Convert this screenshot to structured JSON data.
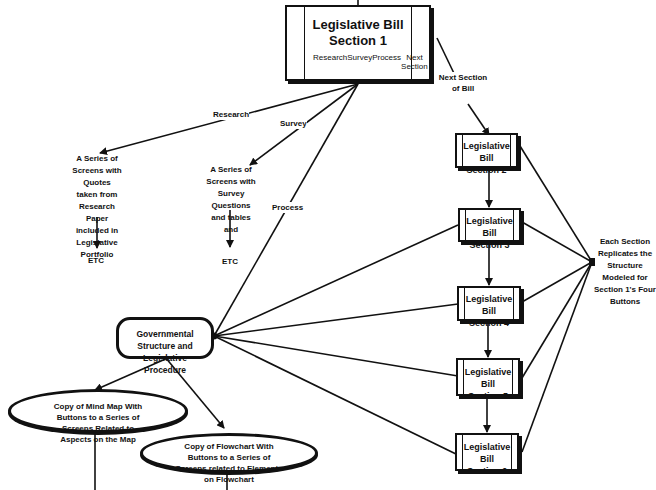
{
  "diagram": {
    "top_node": {
      "title_line1": "Legislative Bill",
      "title_line2": "Section 1",
      "buttons": [
        "Research",
        "Survey",
        "Process",
        "Next Section"
      ]
    },
    "edge_labels": {
      "research": "Research",
      "survey": "Survey",
      "process": "Process",
      "next_section": "Next Section of Bill"
    },
    "research_target": "A Series of Screens with Quotes taken from Research Paper included in Legislative Portfolio",
    "survey_target": "A Series of Screens with Survey Questions and tables and",
    "etc_left": "ETC",
    "etc_right": "ETC",
    "process_node": "Governmental Structure and Legislative Procedure",
    "mind_map_node": "Copy of Mind Map With Buttons to a Series of Screens Related to Aspects on the Map",
    "flowchart_node": "Copy of Flowchart With Buttons to a Series of Screens related to Elements on Flowchart",
    "sections": [
      {
        "line1": "Legislative Bill",
        "line2": "Section 2"
      },
      {
        "line1": "Legislative Bill",
        "line2": "Section 3"
      },
      {
        "line1": "Legislative Bill",
        "line2": "Section 4"
      },
      {
        "line1": "Legislative Bill",
        "line2": "Section 5"
      },
      {
        "line1": "Legislative Bill",
        "line2": "Section 6"
      }
    ],
    "replicates_note": "Each Section Replicates the Structure Modeled for Section 1's Four Buttons"
  }
}
